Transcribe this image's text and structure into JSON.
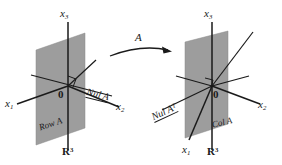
{
  "figure": {
    "type": "linear-algebra-diagram",
    "background_color": "#ffffff",
    "plane_fill_color": "#9d9d9d",
    "line_color": "#1a1a1a",
    "transformation_label": "A"
  },
  "left_diagram": {
    "name": "domain-space",
    "space_label": "R",
    "space_exponent": "3",
    "origin_label": "0",
    "axes": [
      {
        "name": "x3",
        "base": "x",
        "sub": "3"
      },
      {
        "name": "x1",
        "base": "x",
        "sub": "1"
      },
      {
        "name": "x2",
        "base": "x",
        "sub": "2"
      }
    ],
    "plane_label": "Row A",
    "line_label": "Nul A"
  },
  "right_diagram": {
    "name": "codomain-space",
    "space_label": "R",
    "space_exponent": "3",
    "origin_label": "0",
    "axes": [
      {
        "name": "x3",
        "base": "x",
        "sub": "3"
      },
      {
        "name": "x1",
        "base": "x",
        "sub": "1"
      },
      {
        "name": "x2",
        "base": "x",
        "sub": "2"
      }
    ],
    "plane_label": "Col A",
    "line_label": "Nul A",
    "line_label_sup": "T"
  },
  "arrow": {
    "label": "A",
    "direction": "left-to-right"
  }
}
